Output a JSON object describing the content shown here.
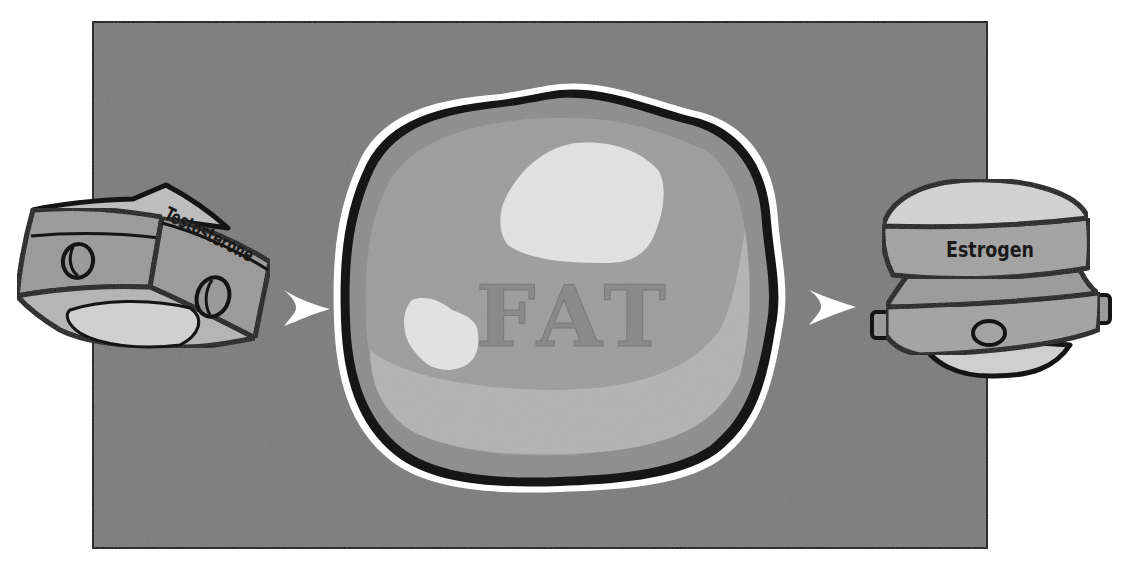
{
  "diagram": {
    "nodes": [
      {
        "id": "testosterone",
        "label": "Testosterone",
        "shape": "pill-box"
      },
      {
        "id": "fat",
        "label": "FAT",
        "shape": "fat-cell"
      },
      {
        "id": "estrogen",
        "label": "Estrogen",
        "shape": "compact-container"
      }
    ],
    "edges": [
      {
        "from": "testosterone",
        "to": "fat",
        "icon": "arrow-right-icon"
      },
      {
        "from": "fat",
        "to": "estrogen",
        "icon": "arrow-right-icon"
      }
    ],
    "colors": {
      "background_panel": "#7b7b7b",
      "panel_border": "#111111",
      "outline": "#141414",
      "box_face": "#9a9a9a",
      "box_light": "#c8c8c8",
      "fat_outer": "#8f8f8f",
      "fat_inner": "#a6a6a6",
      "fat_highlight": "#e2e2e2",
      "arrow": "#ffffff"
    }
  }
}
